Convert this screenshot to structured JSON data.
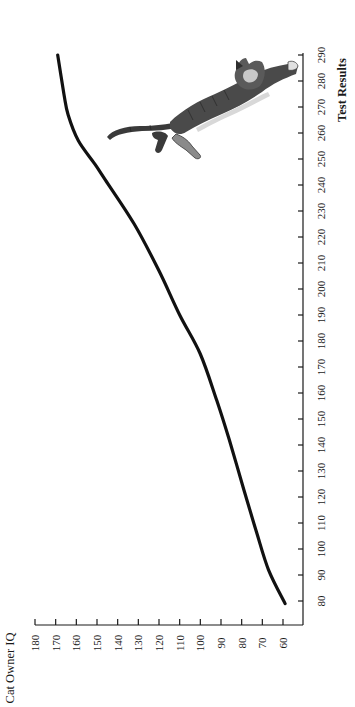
{
  "chart_data": {
    "type": "line",
    "orientation_note": "figure printed rotated 90 degrees clockwise",
    "title": "",
    "xlabel": "Test Results",
    "ylabel": "Cat Owner IQ",
    "xlim": [
      80,
      290
    ],
    "ylim": [
      60,
      180
    ],
    "x_ticks": [
      80,
      90,
      100,
      110,
      120,
      130,
      140,
      150,
      160,
      170,
      180,
      190,
      200,
      210,
      220,
      230,
      240,
      250,
      260,
      270,
      280,
      290
    ],
    "y_ticks": [
      60,
      70,
      80,
      90,
      100,
      110,
      120,
      130,
      140,
      150,
      160,
      170,
      180
    ],
    "grid": false,
    "legend": null,
    "series": [
      {
        "name": "Cat Owner IQ vs Test Results",
        "color": "#111111",
        "x": [
          79,
          92,
          107,
          123,
          142,
          157,
          175,
          190,
          207,
          225,
          242,
          248,
          257,
          267,
          275,
          290
        ],
        "y": [
          59,
          67,
          73,
          79,
          86,
          92,
          100,
          110,
          120,
          132,
          146,
          151,
          159,
          164,
          166,
          169
        ]
      }
    ],
    "annotations": [
      {
        "type": "illustration",
        "label": "leaping tabby cat",
        "near_x": [
          255,
          290
        ],
        "near_y": [
          95,
          165
        ]
      }
    ]
  },
  "axes": {
    "x_title": "Test Results",
    "y_title": "Cat Owner IQ"
  }
}
